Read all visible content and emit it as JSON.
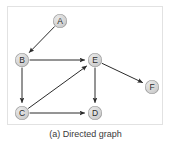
{
  "figure": {
    "caption": "(a) Directed graph",
    "frame": {
      "x": 7,
      "y": 6,
      "width": 156,
      "height": 119,
      "border_color": "#e2e2e2"
    },
    "background_color": "#ffffff"
  },
  "graph": {
    "type": "directed",
    "node_radius": 7,
    "node_fill_color": "#d4d4d4",
    "node_stroke_color": "#9a9a9a",
    "edge_color": "#2b2b2b",
    "label_color": "#2b2b2b",
    "nodes": [
      {
        "id": "A",
        "label": "A",
        "cx": 60,
        "cy": 21
      },
      {
        "id": "B",
        "label": "B",
        "cx": 22,
        "cy": 60
      },
      {
        "id": "C",
        "label": "C",
        "cx": 22,
        "cy": 113
      },
      {
        "id": "D",
        "label": "D",
        "cx": 95,
        "cy": 113
      },
      {
        "id": "E",
        "label": "E",
        "cx": 95,
        "cy": 60
      },
      {
        "id": "F",
        "label": "F",
        "cx": 152,
        "cy": 87
      }
    ],
    "edges": [
      {
        "from": "A",
        "to": "B"
      },
      {
        "from": "B",
        "to": "E"
      },
      {
        "from": "B",
        "to": "C"
      },
      {
        "from": "C",
        "to": "E"
      },
      {
        "from": "C",
        "to": "D"
      },
      {
        "from": "E",
        "to": "D"
      },
      {
        "from": "E",
        "to": "F"
      }
    ]
  }
}
